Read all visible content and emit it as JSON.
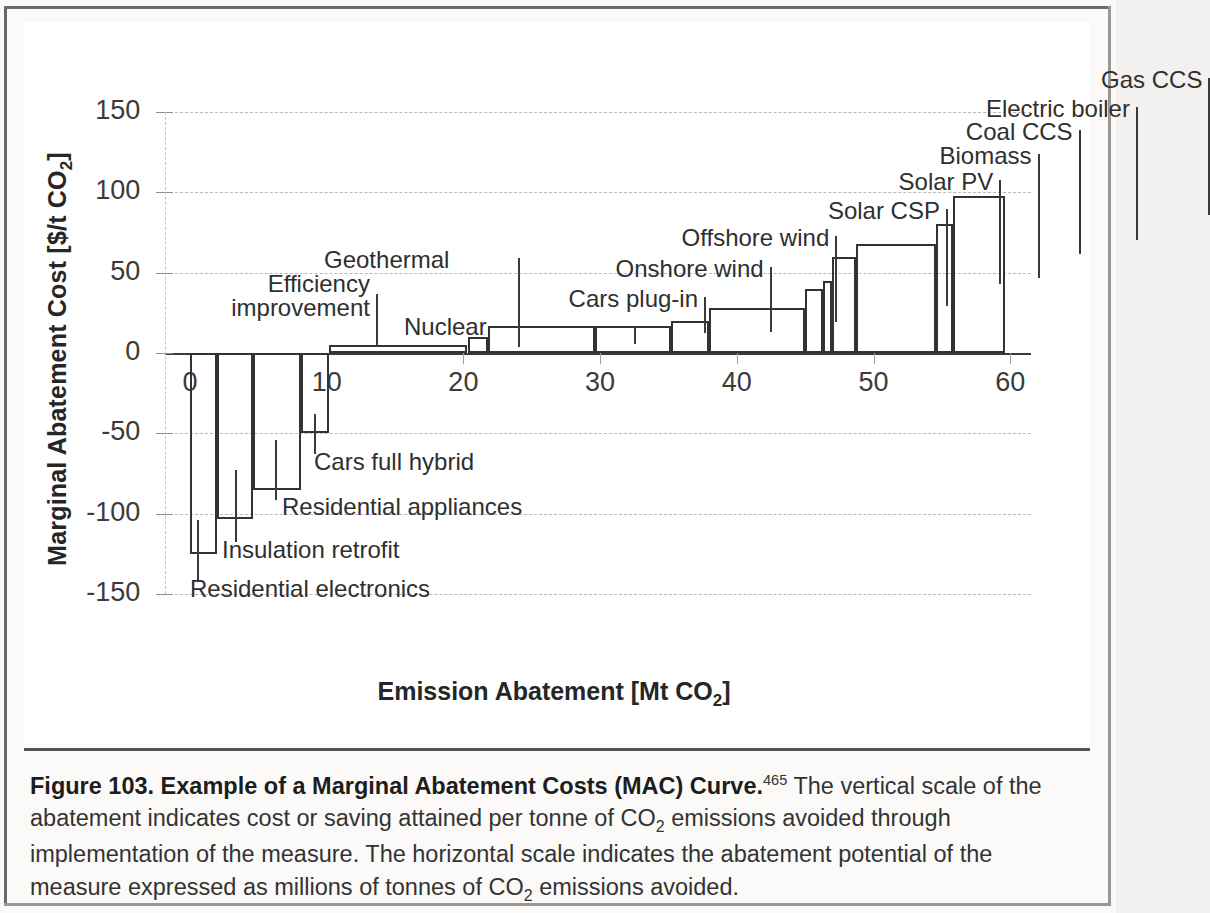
{
  "figure": {
    "caption_bold": "Figure 103. Example of a Marginal Abatement Costs (MAC) Curve.",
    "caption_ref": "465",
    "caption_rest_1": " The vertical scale of the abatement indicates cost or saving attained per tonne of CO",
    "caption_sub_1": "2",
    "caption_rest_2": " emissions avoided through implementation of the measure. The horizontal scale indicates the abatement potential of the measure expressed as millions of tonnes of CO",
    "caption_sub_2": "2",
    "caption_rest_3": " emissions avoided."
  },
  "chart_data": {
    "type": "bar",
    "title": "",
    "xlabel": "Emission Abatement [Mt CO2]",
    "xlabel_main": "Emission Abatement [Mt CO",
    "xlabel_sub": "2",
    "xlabel_tail": "]",
    "ylabel": "Marginal Abatement Cost [$/t CO2]",
    "ylabel_main": "Marginal Abatement Cost [$/t CO",
    "ylabel_sub": "2",
    "ylabel_tail": "]",
    "xlim": [
      0,
      60
    ],
    "ylim": [
      -150,
      150
    ],
    "xticks": [
      "0",
      "10",
      "20",
      "30",
      "40",
      "50",
      "60"
    ],
    "xtick_values": [
      0,
      10,
      20,
      30,
      40,
      50,
      60
    ],
    "yticks": [
      "150",
      "100",
      "50",
      "0",
      "-50",
      "-100",
      "-150"
    ],
    "ytick_values": [
      150,
      100,
      50,
      0,
      -50,
      -100,
      -150
    ],
    "grid": true,
    "legend": "none",
    "bar_color": "#ffffff",
    "bar_edge_color": "#333333",
    "measures": [
      {
        "label": "Residential electronics",
        "x_start": 0.0,
        "x_end": 2.0,
        "width": 2.0,
        "cost": -125
      },
      {
        "label": "Insulation retrofit",
        "x_start": 2.0,
        "x_end": 4.6,
        "width": 2.6,
        "cost": -103
      },
      {
        "label": "Residential appliances",
        "x_start": 4.6,
        "x_end": 8.1,
        "width": 3.5,
        "cost": -85
      },
      {
        "label": "Cars full hybrid",
        "x_start": 8.1,
        "x_end": 10.2,
        "width": 2.1,
        "cost": -50
      },
      {
        "label": "Efficiency improvement",
        "x_start": 10.2,
        "x_end": 20.3,
        "width": 10.1,
        "cost": 5
      },
      {
        "label": "Geothermal",
        "x_start": 10.2,
        "x_end": 20.3,
        "width": 10.1,
        "cost": 5
      },
      {
        "label": "Nuclear",
        "x_start": 20.3,
        "x_end": 21.8,
        "width": 1.5,
        "cost": 10
      },
      {
        "label": "Cars plug-in",
        "x_start": 21.8,
        "x_end": 29.6,
        "width": 7.8,
        "cost": 17
      },
      {
        "label": "Onshore wind",
        "x_start": 29.6,
        "x_end": 35.2,
        "width": 5.6,
        "cost": 17
      },
      {
        "label": "Offshore wind",
        "x_start": 35.2,
        "x_end": 38.0,
        "width": 2.8,
        "cost": 20
      },
      {
        "label": "Solar CSP",
        "x_start": 38.0,
        "x_end": 45.0,
        "width": 7.0,
        "cost": 28
      },
      {
        "label": "Solar PV",
        "x_start": 45.0,
        "x_end": 46.3,
        "width": 1.3,
        "cost": 40
      },
      {
        "label": "Biomass",
        "x_start": 46.3,
        "x_end": 47.0,
        "width": 0.7,
        "cost": 45
      },
      {
        "label": "Coal CCS",
        "x_start": 47.0,
        "x_end": 48.7,
        "width": 1.7,
        "cost": 60
      },
      {
        "label": "Electric boiler",
        "x_start": 48.7,
        "x_end": 54.6,
        "width": 5.9,
        "cost": 68
      },
      {
        "label": "Gas CCS",
        "x_start": 54.6,
        "x_end": 55.8,
        "width": 1.2,
        "cost": 80
      },
      {
        "label": "",
        "x_start": 55.8,
        "x_end": 59.6,
        "width": 3.8,
        "cost": 98
      }
    ],
    "annotations": [
      {
        "name": "efficiency-improvement",
        "text_line1": "Efficiency",
        "text_line2": "improvement",
        "align": "right"
      },
      {
        "name": "geothermal",
        "text_line1": "Geothermal",
        "align": "center"
      },
      {
        "name": "nuclear",
        "text_line1": "Nuclear",
        "align": "left"
      },
      {
        "name": "cars-plug-in",
        "text_line1": "Cars plug-in",
        "align": "right"
      },
      {
        "name": "onshore-wind",
        "text_line1": "Onshore wind",
        "align": "right"
      },
      {
        "name": "offshore-wind",
        "text_line1": "Offshore wind",
        "align": "right"
      },
      {
        "name": "solar-csp",
        "text_line1": "Solar CSP",
        "align": "right"
      },
      {
        "name": "solar-pv",
        "text_line1": "Solar PV",
        "align": "right"
      },
      {
        "name": "biomass",
        "text_line1": "Biomass",
        "align": "right"
      },
      {
        "name": "coal-ccs",
        "text_line1": "Coal CCS",
        "align": "right"
      },
      {
        "name": "electric-boiler",
        "text_line1": "Electric boiler",
        "align": "right"
      },
      {
        "name": "gas-ccs",
        "text_line1": "Gas CCS",
        "align": "right"
      },
      {
        "name": "cars-full-hybrid",
        "text_line1": "Cars full hybrid",
        "align": "left"
      },
      {
        "name": "residential-appliances",
        "text_line1": "Residential appliances",
        "align": "left"
      },
      {
        "name": "insulation-retrofit",
        "text_line1": "Insulation retrofit",
        "align": "left"
      },
      {
        "name": "residential-electronics",
        "text_line1": "Residential electronics",
        "align": "left"
      }
    ]
  },
  "labels": {
    "efficiency_l1": "Efficiency",
    "efficiency_l2": "improvement",
    "geothermal": "Geothermal",
    "nuclear": "Nuclear",
    "cars_plug_in": "Cars plug-in",
    "onshore_wind": "Onshore wind",
    "offshore_wind": "Offshore wind",
    "solar_csp": "Solar CSP",
    "solar_pv": "Solar PV",
    "biomass": "Biomass",
    "coal_ccs": "Coal CCS",
    "electric_boiler": "Electric boiler",
    "gas_ccs": "Gas CCS",
    "cars_full_hybrid": "Cars full hybrid",
    "residential_appliances": "Residential appliances",
    "insulation_retrofit": "Insulation retrofit",
    "residential_electronics": "Residential electronics"
  }
}
